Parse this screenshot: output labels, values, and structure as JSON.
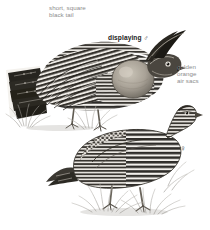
{
  "plate": {
    "title": "Greater Prairie-Chicken plate",
    "background_color": "#ffffff",
    "ink_color": "#1b1b1b",
    "label_color": "#8d8d8d",
    "style": "grayscale pen-and-ink field guide illustration"
  },
  "labels": {
    "tail": "short, square\nblack tail",
    "displaying": "displaying ♂",
    "air_sacs": "golden\norange\nair sacs",
    "female_symbol": "♀"
  },
  "subjects": [
    {
      "name": "displaying-male",
      "pose": "displaying, tail erect, air sac inflated, pinnae raised",
      "sex_symbol": "♂"
    },
    {
      "name": "female",
      "pose": "standing in grass, barred plumage",
      "sex_symbol": "♀"
    }
  ],
  "ground": {
    "name": "grass-tussocks",
    "count": 4
  }
}
